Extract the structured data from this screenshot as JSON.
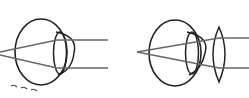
{
  "diagram": {
    "panels": [
      {
        "id": "uncorrected-eye",
        "description": "Eye with parallel rays converging behind eye (farsightedness), no corrective lens"
      },
      {
        "id": "corrected-eye",
        "description": "Eye with converging convex lens in front, rays focus on retina"
      }
    ],
    "colors": {
      "outline": "#222222",
      "ray": "#666666",
      "background": "#ffffff"
    },
    "annotation": "~ ~ ~"
  }
}
